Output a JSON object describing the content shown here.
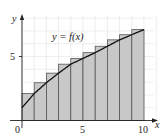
{
  "chart_data": {
    "type": "bar",
    "title": "",
    "curve_label": "y = f(x)",
    "xlabel": "x",
    "ylabel": "y",
    "x_ticks": [
      "0",
      "5",
      "10"
    ],
    "y_ticks": [
      "5"
    ],
    "xlim": [
      0,
      10
    ],
    "ylim": [
      0,
      8
    ],
    "grid": true,
    "rect_width": 1,
    "categories": [
      "[0,1]",
      "[1,2]",
      "[2,3]",
      "[3,4]",
      "[4,5]",
      "[5,6]",
      "[6,7]",
      "[7,8]",
      "[8,9]",
      "[9,10]"
    ],
    "values": [
      2.1,
      2.95,
      3.7,
      4.4,
      4.85,
      5.3,
      5.8,
      6.3,
      6.7,
      7.1
    ],
    "curve": {
      "x": [
        0,
        1,
        2,
        3,
        4,
        5,
        6,
        7,
        8,
        9,
        10
      ],
      "y": [
        1.0,
        2.1,
        2.95,
        3.7,
        4.4,
        4.85,
        5.3,
        5.8,
        6.3,
        6.7,
        7.1
      ]
    },
    "colors": {
      "rect_fill": "#c8c8c8",
      "rect_stroke": "#555555",
      "curve": "#111111",
      "grid": "#e6e6e6",
      "axis": "#222222"
    }
  }
}
